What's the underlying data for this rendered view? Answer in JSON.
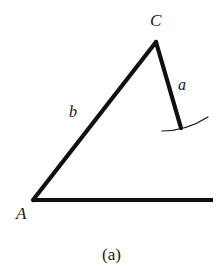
{
  "figure": {
    "caption": "(a)",
    "background_color": "#ffffff",
    "stroke_color": "#101010",
    "thick_stroke_width": 4.2,
    "thin_stroke_width": 1.2,
    "labels": {
      "vertex_c": "C",
      "vertex_a": "A",
      "side_b": "b",
      "side_a": "a"
    },
    "geometry": {
      "points": {
        "A": [
          33,
          200
        ],
        "C": [
          156,
          42
        ],
        "a_end": [
          181,
          128
        ],
        "baseline_end": [
          213,
          200
        ]
      },
      "segments": [
        {
          "name": "side-b",
          "from": "A",
          "to": "C",
          "label": "b",
          "style": "thick"
        },
        {
          "name": "side-a",
          "from": "C",
          "to": "a_end",
          "label": "a",
          "style": "thick"
        },
        {
          "name": "baseline",
          "from": "A",
          "to": "baseline_end",
          "label": "",
          "style": "thick"
        }
      ],
      "arc": {
        "name": "ground-arc",
        "start": [
          162,
          131
        ],
        "control": [
          185,
          130
        ],
        "end": [
          208,
          117
        ],
        "style": "thin"
      }
    }
  }
}
